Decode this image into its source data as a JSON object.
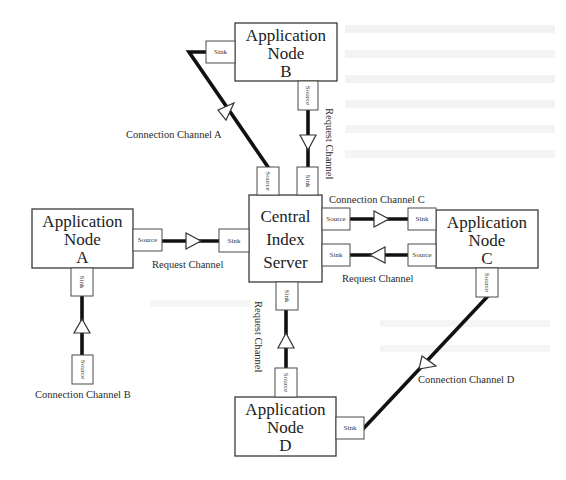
{
  "nodes": {
    "server": {
      "line1": "Central",
      "line2": "Index",
      "line3": "Server"
    },
    "a": {
      "line1": "Application",
      "line2": "Node",
      "line3": "A"
    },
    "b": {
      "line1": "Application",
      "line2": "Node",
      "line3": "B"
    },
    "c": {
      "line1": "Application",
      "line2": "Node",
      "line3": "C"
    },
    "d": {
      "line1": "Application",
      "line2": "Node",
      "line3": "D"
    }
  },
  "ports": {
    "source": "Source",
    "sink": "Sink"
  },
  "channels": {
    "connection_a": "Connection Channel A",
    "connection_b": "Connection Channel B",
    "connection_c": "Connection Channel C",
    "connection_d": "Connection Channel D",
    "request_a": "Request Channel",
    "request_b": "Request Channel",
    "request_c": "Request Channel",
    "request_d": "Request Channel"
  }
}
